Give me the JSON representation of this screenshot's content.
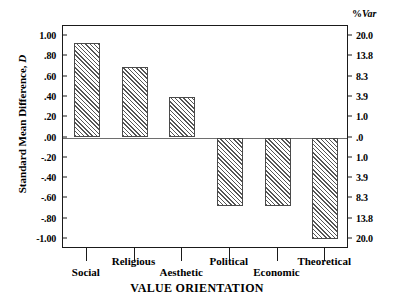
{
  "chart_data": {
    "type": "bar",
    "title": "",
    "subtitle": "",
    "xlabel": "VALUE ORIENTATION",
    "ylabel": "Standard Mean Difference, D",
    "ylabel_plain": "Standard  Mean  Difference,",
    "ylabel_italic": "D",
    "y2label": "%Var",
    "y2label_plain": "%",
    "y2label_italic": "Var",
    "categories": [
      "Social",
      "Religious",
      "Aesthetic",
      "Political",
      "Economic",
      "Theoretical"
    ],
    "values": [
      0.93,
      0.7,
      0.4,
      -0.68,
      -0.68,
      -1.0
    ],
    "ylim": [
      -1.1,
      1.1
    ],
    "yticks": [
      1.0,
      0.8,
      0.6,
      0.4,
      0.2,
      0.0,
      -0.2,
      -0.4,
      -0.6,
      -0.8,
      -1.0
    ],
    "ytick_labels": [
      "1.00",
      ".80",
      ".60",
      ".40",
      ".20",
      ".00",
      "-.20",
      "-.40",
      "-.60",
      "-.80",
      "-1.00"
    ],
    "y2tick_labels": [
      "20.0",
      "13.8",
      "8.3",
      "3.9",
      "1.0",
      ".0",
      "1.0",
      "3.9",
      "8.3",
      "13.8",
      "20.0"
    ],
    "y2tick_values": [
      20.0,
      13.8,
      8.3,
      3.9,
      1.0,
      0.0,
      1.0,
      3.9,
      8.3,
      13.8,
      20.0
    ],
    "grid": false,
    "legend": false,
    "bar_fill": "diagonal-hatch",
    "bar_edge_color": "#4a4a4a",
    "axis_color": "#1a1a1a",
    "zero_line_color": "#6e6e6e",
    "category_label_rows": [
      "bottom",
      "top",
      "bottom",
      "top",
      "bottom",
      "top"
    ]
  }
}
